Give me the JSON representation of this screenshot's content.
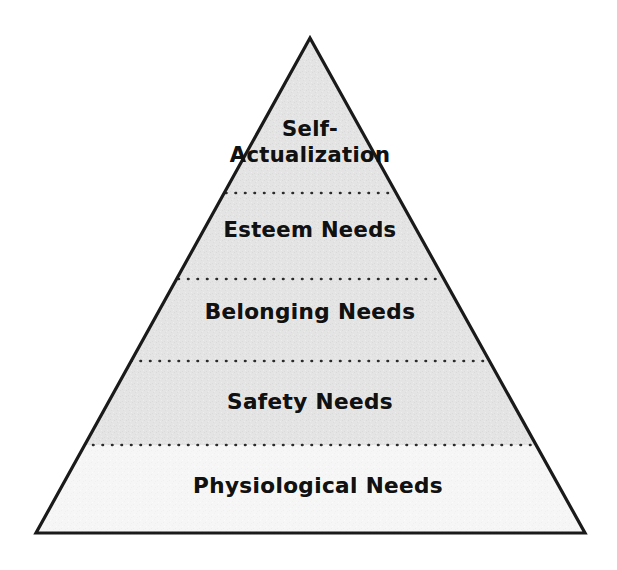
{
  "diagram": {
    "name": "maslow-hierarchy-of-needs-pyramid",
    "type": "pyramid",
    "tier_count": 5,
    "background_color": "#ffffff",
    "outline_color": "#1a1a1a",
    "outline_width_px": 3,
    "divider_style": "dotted",
    "divider_color": "#2b2b2b",
    "geometry": {
      "apex_x": 310,
      "apex_y": 38,
      "base_left_x": 36,
      "base_right_x": 585,
      "base_y": 533,
      "divider_y": [
        193,
        279,
        361,
        445
      ]
    },
    "tiers": [
      {
        "rank": 1,
        "position": "top",
        "label": "Self-\nActualization",
        "fill_color": "#e4e4e4"
      },
      {
        "rank": 2,
        "position": "second",
        "label": "Esteem Needs",
        "fill_color": "#e4e4e4"
      },
      {
        "rank": 3,
        "position": "middle",
        "label": "Belonging Needs",
        "fill_color": "#e4e4e4"
      },
      {
        "rank": 4,
        "position": "fourth",
        "label": "Safety Needs",
        "fill_color": "#e4e4e4"
      },
      {
        "rank": 5,
        "position": "base",
        "label": "Physiological Needs",
        "fill_color": "#f6f6f6"
      }
    ]
  }
}
